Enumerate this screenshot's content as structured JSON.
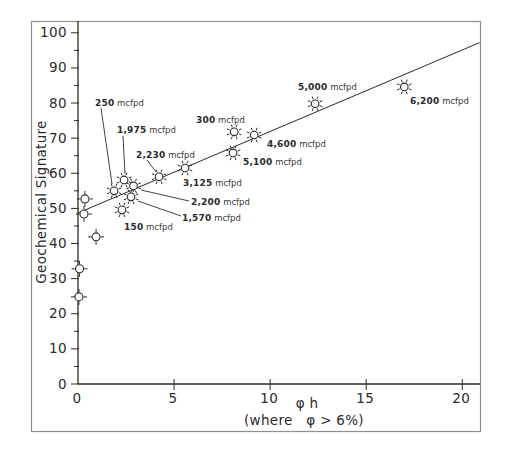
{
  "chart_data": {
    "type": "scatter",
    "title": "",
    "ylabel": "Geochemical Signature",
    "xlabel_line1": "φ h",
    "xlabel_line2": "(where   φ > 6%)",
    "unit_suffix": "mcfpd",
    "xlim": [
      0,
      21
    ],
    "ylim": [
      0,
      100
    ],
    "x_ticks": [
      0,
      5,
      10,
      15,
      20
    ],
    "y_ticks": [
      0,
      10,
      20,
      30,
      40,
      50,
      60,
      70,
      80,
      90,
      100
    ],
    "y_minor_ticks": [
      5,
      15,
      25,
      35,
      45,
      55,
      65,
      75,
      85,
      95
    ],
    "grid": false,
    "legend": "none",
    "trendline": {
      "x1": 0,
      "y1": 48.7,
      "x2": 20.9,
      "y2": 97.2
    },
    "points_labeled": [
      {
        "label": "250",
        "x": 1.88,
        "y": 55.0,
        "marker": "sun",
        "label_px": [
          95,
          106
        ],
        "leader_px": [
          101,
          108,
          112,
          184
        ]
      },
      {
        "label": "1,975",
        "x": 2.4,
        "y": 58.1,
        "marker": "sun",
        "label_px": [
          117,
          133
        ],
        "leader_px": [
          123,
          136,
          125,
          174
        ]
      },
      {
        "label": "2,230",
        "x": 4.22,
        "y": 59.0,
        "marker": "sun",
        "label_px": [
          136,
          158
        ],
        "leader_px": [
          147,
          160,
          156,
          172
        ]
      },
      {
        "label": "300",
        "x": 8.13,
        "y": 71.8,
        "marker": "sun",
        "label_px": [
          196,
          123
        ],
        "leader_px": null
      },
      {
        "label": "2,200",
        "x": 2.89,
        "y": 56.4,
        "marker": "sun",
        "label_px": [
          191,
          205
        ],
        "leader_px": [
          189,
          201,
          141,
          190
        ]
      },
      {
        "label": "1,570",
        "x": 2.76,
        "y": 53.3,
        "marker": "sun",
        "label_px": [
          182,
          221
        ],
        "leader_px": [
          181,
          216,
          138,
          201
        ]
      },
      {
        "label": "150",
        "x": 2.29,
        "y": 49.6,
        "marker": "sun",
        "label_px": [
          124,
          230
        ],
        "leader_px": null
      },
      {
        "label": "3,125",
        "x": 5.57,
        "y": 61.5,
        "marker": "sun",
        "label_px": [
          183,
          186
        ],
        "leader_px": null
      },
      {
        "label": "5,100",
        "x": 8.07,
        "y": 65.8,
        "marker": "sun",
        "label_px": [
          243,
          165
        ],
        "leader_px": null
      },
      {
        "label": "4,600",
        "x": 9.17,
        "y": 70.9,
        "marker": "sun",
        "label_px": [
          267,
          147
        ],
        "leader_px": null
      },
      {
        "label": "5,000",
        "x": 12.34,
        "y": 79.8,
        "marker": "sun",
        "label_px": [
          298,
          90
        ],
        "leader_px": null
      },
      {
        "label": "6,200",
        "x": 16.98,
        "y": 84.6,
        "marker": "sun",
        "label_px": [
          410,
          104
        ],
        "leader_px": null
      }
    ],
    "points_unlabeled": [
      {
        "x": 0.36,
        "y": 52.7,
        "marker": "cross-circle"
      },
      {
        "x": 0.31,
        "y": 48.4,
        "marker": "cross-circle"
      },
      {
        "x": 0.94,
        "y": 41.9,
        "marker": "cross-circle"
      },
      {
        "x": 0.08,
        "y": 32.8,
        "marker": "cross-circle"
      },
      {
        "x": 0.05,
        "y": 24.8,
        "marker": "cross-circle"
      }
    ]
  }
}
